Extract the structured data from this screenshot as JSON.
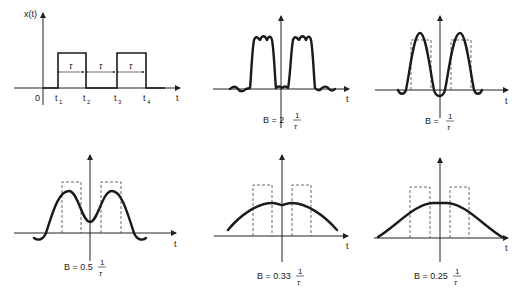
{
  "figure": {
    "panel_original": {
      "y_axis_label": "x(t)",
      "x_axis_label": "t",
      "origin_label": "0",
      "time_labels": [
        "t1",
        "t2",
        "t3",
        "t4"
      ],
      "tick_main": [
        "t",
        "t",
        "t",
        "t"
      ],
      "tick_sub": [
        "1",
        "2",
        "3",
        "4"
      ],
      "interval_labels": [
        "τ",
        "τ",
        "τ"
      ]
    },
    "panels": [
      {
        "x_axis_label": "t",
        "caption_prefix": "B = 2",
        "caption_num": "1",
        "caption_den": "τ"
      },
      {
        "x_axis_label": "t",
        "caption_prefix": "B =",
        "caption_num": "1",
        "caption_den": "τ"
      },
      {
        "x_axis_label": "t",
        "caption_prefix": "B = 0.5",
        "caption_num": "1",
        "caption_den": "τ"
      },
      {
        "x_axis_label": "t",
        "caption_prefix": "B = 0.33",
        "caption_num": "1",
        "caption_den": "τ"
      },
      {
        "x_axis_label": "t",
        "caption_prefix": "B = 0.25",
        "caption_num": "1",
        "caption_den": "τ"
      }
    ]
  },
  "colors": {
    "ink": "#1a1a1a",
    "background": "#ffffff"
  }
}
